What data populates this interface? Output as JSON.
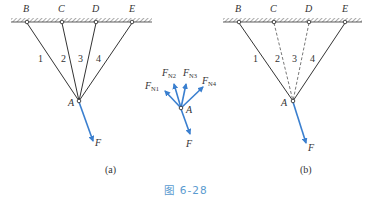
{
  "figure": {
    "caption": "图 6-28",
    "caption_color": "#5a9bd0",
    "line_color": "#333333",
    "force_color": "#3a7fcf"
  },
  "panel_a": {
    "label": "(a)",
    "supports": [
      "B",
      "C",
      "D",
      "E"
    ],
    "bars": [
      "1",
      "2",
      "3",
      "4"
    ],
    "joint": "A",
    "force": "F"
  },
  "free_body": {
    "joint": "A",
    "forces": [
      "F",
      "N1",
      "N2",
      "N3",
      "N4"
    ],
    "force_main": "F",
    "force_prefix": "F",
    "subscripts": [
      "N1",
      "N2",
      "N3",
      "N4"
    ]
  },
  "panel_b": {
    "label": "(b)",
    "supports": [
      "B",
      "C",
      "D",
      "E"
    ],
    "bars": [
      "1",
      "2",
      "3",
      "4"
    ],
    "joint": "A",
    "force": "F",
    "dashed_bars": [
      "2",
      "3"
    ]
  }
}
